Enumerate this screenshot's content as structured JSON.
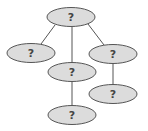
{
  "diagram": {
    "type": "tree",
    "colors": {
      "node_fill": "#dcdcdc",
      "node_stroke": "#555555",
      "edge": "#555555",
      "text": "#444444"
    },
    "nodes": [
      {
        "id": "root",
        "label": "?",
        "cx": 71,
        "cy": 17,
        "rx": 24,
        "ry": 9.5
      },
      {
        "id": "left",
        "label": "?",
        "cx": 31,
        "cy": 53,
        "rx": 24,
        "ry": 9.5
      },
      {
        "id": "middle",
        "label": "?",
        "cx": 72,
        "cy": 72,
        "rx": 24,
        "ry": 9.5
      },
      {
        "id": "right",
        "label": "?",
        "cx": 113,
        "cy": 54,
        "rx": 24,
        "ry": 9.5
      },
      {
        "id": "right-child",
        "label": "?",
        "cx": 113,
        "cy": 94,
        "rx": 24,
        "ry": 9.5
      },
      {
        "id": "bottom",
        "label": "?",
        "cx": 72,
        "cy": 115,
        "rx": 24,
        "ry": 9.5
      }
    ],
    "edges": [
      {
        "from": "root",
        "to": "left",
        "x1": 55,
        "y1": 25,
        "x2": 41,
        "y2": 44
      },
      {
        "from": "root",
        "to": "middle",
        "x1": 72,
        "y1": 27,
        "x2": 72,
        "y2": 63
      },
      {
        "from": "root",
        "to": "right",
        "x1": 88,
        "y1": 24,
        "x2": 104,
        "y2": 45
      },
      {
        "from": "middle",
        "to": "bottom",
        "x1": 72,
        "y1": 82,
        "x2": 72,
        "y2": 106
      },
      {
        "from": "right",
        "to": "right-child",
        "x1": 113,
        "y1": 64,
        "x2": 113,
        "y2": 85
      }
    ]
  }
}
